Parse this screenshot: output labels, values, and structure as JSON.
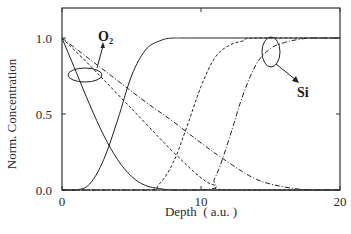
{
  "chart_data": {
    "type": "line",
    "title": "",
    "xlabel": "Depth  ( a.u. )",
    "ylabel": "Norm. Concentration",
    "xlim": [
      0,
      20
    ],
    "ylim": [
      0,
      1.2
    ],
    "x_ticks": [
      0,
      10,
      20
    ],
    "x_tick_labels": [
      "0",
      "10",
      "20"
    ],
    "y_ticks": [
      0.0,
      0.5,
      1.0
    ],
    "y_tick_labels": [
      "0.0",
      "0.5",
      "1.0"
    ],
    "grid": false,
    "legend": null,
    "annotations": [
      {
        "text": "O₂",
        "points_to": "O2 curves (ellipse near depth ~2, conc ~0.75)"
      },
      {
        "text": "Si",
        "points_to": "Si curves (ellipse near depth ~14.5, conc ~1.0)"
      }
    ],
    "series": [
      {
        "name": "O2 (solid)",
        "species": "O2",
        "style": "solid",
        "x": [
          0,
          1,
          2,
          3,
          4,
          5,
          6,
          7,
          8,
          10,
          20
        ],
        "y": [
          1.0,
          0.78,
          0.56,
          0.36,
          0.2,
          0.09,
          0.03,
          0.01,
          0.0,
          0.0,
          0.0
        ]
      },
      {
        "name": "O2 (dashed)",
        "species": "O2",
        "style": "dashed",
        "x": [
          0,
          2,
          4,
          6,
          8,
          10,
          11,
          12,
          20
        ],
        "y": [
          1.0,
          0.82,
          0.63,
          0.44,
          0.25,
          0.08,
          0.03,
          0.0,
          0.0
        ]
      },
      {
        "name": "O2 (dash-dot)",
        "species": "O2",
        "style": "dash-dot",
        "x": [
          0,
          2,
          4,
          6,
          8,
          10,
          12,
          14,
          16,
          18,
          20
        ],
        "y": [
          1.0,
          0.86,
          0.72,
          0.58,
          0.45,
          0.31,
          0.18,
          0.07,
          0.02,
          0.0,
          0.0
        ]
      },
      {
        "name": "Si (solid)",
        "species": "Si",
        "style": "solid",
        "x": [
          0,
          1,
          2,
          3,
          4,
          5,
          6,
          7,
          8,
          10,
          20
        ],
        "y": [
          0.0,
          0.0,
          0.04,
          0.2,
          0.46,
          0.75,
          0.92,
          0.98,
          1.0,
          1.0,
          1.0
        ]
      },
      {
        "name": "Si (dashed)",
        "species": "Si",
        "style": "dashed",
        "x": [
          0,
          6,
          7,
          8,
          9,
          10,
          11,
          12,
          13,
          14,
          20
        ],
        "y": [
          0.0,
          0.0,
          0.04,
          0.18,
          0.42,
          0.68,
          0.87,
          0.95,
          0.98,
          1.0,
          1.0
        ]
      },
      {
        "name": "Si (dash-dot)",
        "species": "Si",
        "style": "dash-dot",
        "x": [
          0,
          10,
          11,
          12,
          13,
          14,
          15,
          16,
          17,
          18,
          20
        ],
        "y": [
          0.0,
          0.0,
          0.08,
          0.33,
          0.62,
          0.83,
          0.93,
          0.97,
          0.99,
          1.0,
          1.0
        ]
      }
    ]
  }
}
